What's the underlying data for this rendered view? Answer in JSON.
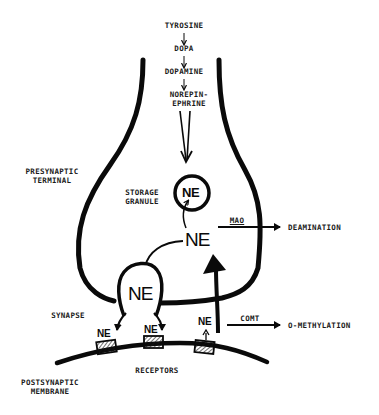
{
  "diagram": {
    "colors": {
      "ink": "#0a0a0a",
      "background": "#ffffff"
    },
    "synthesis_pathway": [
      {
        "label": "TYROSINE"
      },
      {
        "label": "DOPA"
      },
      {
        "label": "DOPAMINE"
      },
      {
        "label": "NOREPIN-",
        "label2": "EPHRINE"
      }
    ],
    "regions": {
      "presynaptic_terminal": {
        "line1": "PRESYNAPTIC",
        "line2": "TERMINAL"
      },
      "storage_granule": {
        "line1": "STORAGE",
        "line2": "GRANULE"
      },
      "synapse": "SYNAPSE",
      "receptors": "RECEPTORS",
      "postsynaptic_membrane": {
        "line1": "POSTSYNAPTIC",
        "line2": "MEMBRANE"
      }
    },
    "molecules": {
      "granule_ne": "NE",
      "cytoplasm_ne": "NE",
      "vesicle_ne": "NE",
      "receptor_ne_1": "NE",
      "receptor_ne_2": "NE",
      "receptor_ne_3": "NE"
    },
    "enzymes": {
      "mao": {
        "label": "MAO",
        "product": "DEAMINATION"
      },
      "comt": {
        "label": "COMT",
        "product": "O-METHYLATION"
      }
    },
    "icons": {
      "arrow": "arrow-icon",
      "receptor": "hatched-receptor-icon",
      "granule": "circle-granule-icon",
      "vesicle": "vesicle-icon"
    }
  }
}
